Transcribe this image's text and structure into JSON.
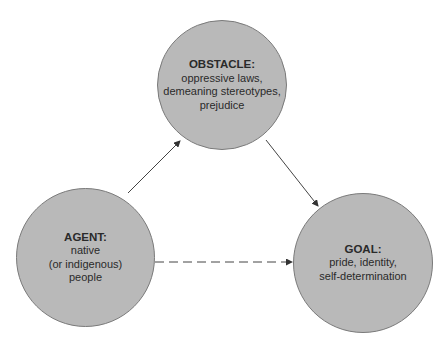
{
  "diagram": {
    "nodes": [
      {
        "id": "obstacle",
        "title": "OBSTACLE:",
        "lines": [
          "oppressive laws,",
          "demeaning stereotypes,",
          "prejudice"
        ]
      },
      {
        "id": "agent",
        "title": "AGENT:",
        "lines": [
          "native",
          "(or indigenous)",
          "people"
        ]
      },
      {
        "id": "goal",
        "title": "GOAL:",
        "lines": [
          "pride, identity,",
          "self-determination"
        ]
      }
    ],
    "edges": [
      {
        "from": "agent",
        "to": "obstacle",
        "style": "solid"
      },
      {
        "from": "obstacle",
        "to": "goal",
        "style": "solid"
      },
      {
        "from": "agent",
        "to": "goal",
        "style": "dashed"
      }
    ],
    "colors": {
      "node_fill": "#b9b9b9",
      "node_stroke": "#7a7a7a",
      "line": "#444444"
    }
  }
}
